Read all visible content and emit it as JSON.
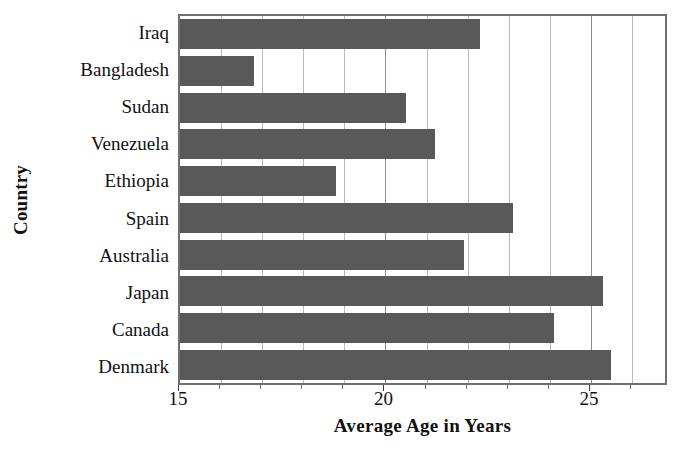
{
  "chart_data": {
    "type": "bar",
    "orientation": "horizontal",
    "title": "",
    "xlabel": "Average Age in Years",
    "ylabel": "Country",
    "categories": [
      "Iraq",
      "Bangladesh",
      "Sudan",
      "Venezuela",
      "Ethiopia",
      "Spain",
      "Australia",
      "Japan",
      "Canada",
      "Denmark"
    ],
    "values": [
      22.3,
      16.8,
      20.5,
      21.2,
      18.8,
      23.1,
      21.9,
      25.3,
      24.1,
      25.5
    ],
    "xlim": [
      15,
      26.9
    ],
    "xticks": [
      15,
      20,
      25
    ],
    "xtick_labels": [
      "15",
      "20",
      "25"
    ],
    "minor_tick_step": 1,
    "grid": "vertical",
    "legend": "none",
    "bar_color": "#595959",
    "grid_color": "#b9b9b9",
    "axis_color": "#6f6f6f",
    "text_color": "#111111",
    "series": [
      {
        "name": "Average Age in Years",
        "values": [
          22.3,
          16.8,
          20.5,
          21.2,
          18.8,
          23.1,
          21.9,
          25.3,
          24.1,
          25.5
        ]
      }
    ]
  }
}
